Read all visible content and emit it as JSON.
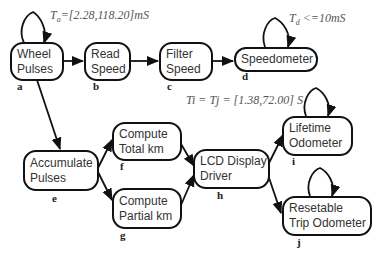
{
  "diagram": {
    "nodes": [
      {
        "id": "a",
        "line1": "Wheel",
        "line2": "Pulses",
        "label": "a"
      },
      {
        "id": "b",
        "line1": "Read",
        "line2": "Speed",
        "label": "b"
      },
      {
        "id": "c",
        "line1": "Filter",
        "line2": "Speed",
        "label": "c"
      },
      {
        "id": "d",
        "line1": "Speedometer",
        "line2": "",
        "label": "d"
      },
      {
        "id": "e",
        "line1": "Accumulate",
        "line2": "Pulses",
        "label": "e"
      },
      {
        "id": "f",
        "line1": "Compute",
        "line2": "Total km",
        "label": "f"
      },
      {
        "id": "g",
        "line1": "Compute",
        "line2": "Partial km",
        "label": "g"
      },
      {
        "id": "h",
        "line1": "LCD Display",
        "line2": "Driver",
        "label": "h"
      },
      {
        "id": "i",
        "line1": "Lifetime",
        "line2": "Odometer",
        "label": "i"
      },
      {
        "id": "j",
        "line1": "Resetable",
        "line2": "Trip Odometer",
        "label": "j"
      }
    ],
    "edges": [
      [
        "a",
        "b"
      ],
      [
        "b",
        "c"
      ],
      [
        "c",
        "d"
      ],
      [
        "a",
        "e"
      ],
      [
        "e",
        "f"
      ],
      [
        "e",
        "g"
      ],
      [
        "f",
        "h"
      ],
      [
        "g",
        "h"
      ],
      [
        "h",
        "i"
      ],
      [
        "h",
        "j"
      ],
      [
        "a",
        "a"
      ],
      [
        "d",
        "d"
      ],
      [
        "i",
        "i"
      ],
      [
        "j",
        "j"
      ]
    ],
    "annotations": {
      "ta": {
        "sym": "T",
        "sub": "a",
        "text": "=[2.28,118.20]mS"
      },
      "td": {
        "sym": "T",
        "sub": "d",
        "text": " <=10mS"
      },
      "tij": {
        "text": "Ti = Tj = [1.38,72.00] S"
      }
    }
  }
}
